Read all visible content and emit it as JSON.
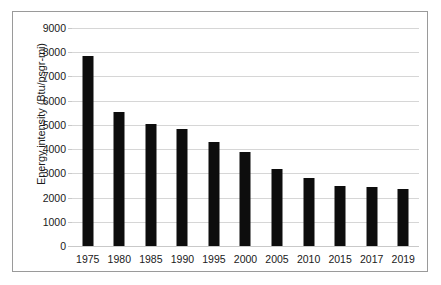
{
  "chart_data": {
    "type": "bar",
    "title": "",
    "xlabel": "",
    "ylabel": "Energy intensity (Btu/psgr-mi)",
    "categories": [
      "1975",
      "1980",
      "1985",
      "1990",
      "1995",
      "2000",
      "2005",
      "2010",
      "2015",
      "2017",
      "2019"
    ],
    "values": [
      7830,
      5550,
      5030,
      4830,
      4300,
      3890,
      3180,
      2820,
      2490,
      2420,
      2350
    ],
    "ylim": [
      0,
      9000
    ],
    "ytick_labels": [
      "9000",
      "8000",
      "7000",
      "6000",
      "5000",
      "4000",
      "3000",
      "2000",
      "1000",
      "0"
    ],
    "ytick_values": [
      9000,
      8000,
      7000,
      6000,
      5000,
      4000,
      3000,
      2000,
      1000,
      0
    ],
    "grid": true,
    "legend": "none",
    "series_color": "#0d0d0d",
    "gridline_color": "#d6d6d6",
    "border_color": "#9a9a9a",
    "background_color": "#ffffff"
  }
}
